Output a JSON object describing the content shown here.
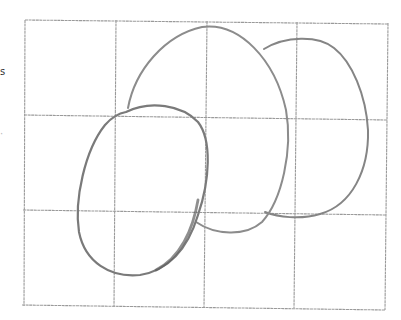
{
  "image": {
    "description": "Pencil sketch of three overlapping ovals on a rectangular grid",
    "background": "#ffffff",
    "pencil_color": "#7a7a7a",
    "grid_color": "#9a9a9a"
  },
  "grid": {
    "columns": 4,
    "rows": 3,
    "x_lines": [
      25,
      116,
      207,
      297,
      388
    ],
    "y_lines": [
      20,
      115,
      210,
      306
    ]
  },
  "shapes": [
    {
      "name": "large-center-oval",
      "cx": 207,
      "cy": 125,
      "rx": 80,
      "ry": 105
    },
    {
      "name": "right-oval",
      "cx": 315,
      "cy": 128,
      "rx": 53,
      "ry": 88
    },
    {
      "name": "left-front-oval",
      "cx": 142,
      "cy": 190,
      "rx": 65,
      "ry": 86
    }
  ],
  "edge_marks": [
    {
      "text": "s",
      "y": 66
    },
    {
      "text": "·",
      "y": 128
    }
  ]
}
